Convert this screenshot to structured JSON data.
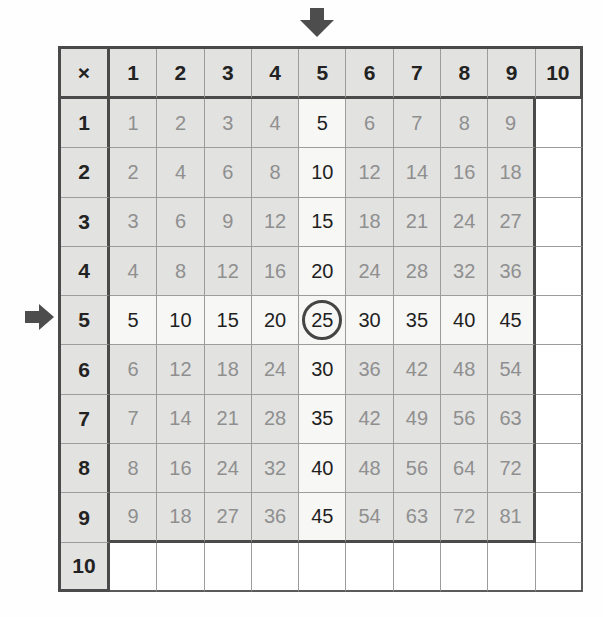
{
  "table": {
    "operator_symbol": "×",
    "column_headers": [
      "1",
      "2",
      "3",
      "4",
      "5",
      "6",
      "7",
      "8",
      "9",
      "10"
    ],
    "row_headers": [
      "1",
      "2",
      "3",
      "4",
      "5",
      "6",
      "7",
      "8",
      "9",
      "10"
    ],
    "body": [
      [
        "1",
        "2",
        "3",
        "4",
        "5",
        "6",
        "7",
        "8",
        "9",
        ""
      ],
      [
        "2",
        "4",
        "6",
        "8",
        "10",
        "12",
        "14",
        "16",
        "18",
        ""
      ],
      [
        "3",
        "6",
        "9",
        "12",
        "15",
        "18",
        "21",
        "24",
        "27",
        ""
      ],
      [
        "4",
        "8",
        "12",
        "16",
        "20",
        "24",
        "28",
        "32",
        "36",
        ""
      ],
      [
        "5",
        "10",
        "15",
        "20",
        "25",
        "30",
        "35",
        "40",
        "45",
        ""
      ],
      [
        "6",
        "12",
        "18",
        "24",
        "30",
        "36",
        "42",
        "48",
        "54",
        ""
      ],
      [
        "7",
        "14",
        "21",
        "28",
        "35",
        "42",
        "49",
        "56",
        "63",
        ""
      ],
      [
        "8",
        "16",
        "24",
        "32",
        "40",
        "48",
        "56",
        "64",
        "72",
        ""
      ],
      [
        "9",
        "18",
        "27",
        "36",
        "45",
        "54",
        "63",
        "72",
        "81",
        ""
      ],
      [
        "",
        "",
        "",
        "",
        "",
        "",
        "",
        "",
        "",
        ""
      ]
    ],
    "highlighted_row_header": "5",
    "highlighted_column_header": "5",
    "circled_value": "25"
  },
  "annotations": {
    "top_arrow": "down-arrow pointing at column 5",
    "left_arrow": "right-arrow pointing at row 5"
  },
  "colors": {
    "cell_gray": "#e2e2e1",
    "highlight_white": "#f7f7f6",
    "empty_white": "#ffffff",
    "grid_thin": "#9c9c9c",
    "grid_thick": "#4a4a4a",
    "header_text": "#222222",
    "product_text": "#8f8f8f",
    "highlight_text": "#1f1f1f",
    "arrow": "#4d4d4d",
    "circle_ring": "#454545"
  }
}
